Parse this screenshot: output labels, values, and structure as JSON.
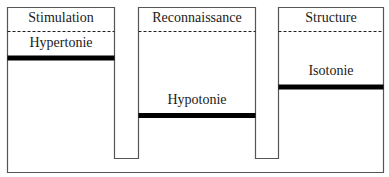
{
  "diagram": {
    "columns": [
      {
        "header": "Stimulation",
        "state_label": "Hypertonie",
        "bar_level": "high"
      },
      {
        "header": "Reconnaissance",
        "state_label": "Hypotonie",
        "bar_level": "low"
      },
      {
        "header": "Structure",
        "state_label": "Isotonie",
        "bar_level": "middle"
      }
    ],
    "colors": {
      "outline": "#555555",
      "bar": "#000000",
      "background": "#ffffff",
      "text": "#1a1a1a"
    }
  }
}
